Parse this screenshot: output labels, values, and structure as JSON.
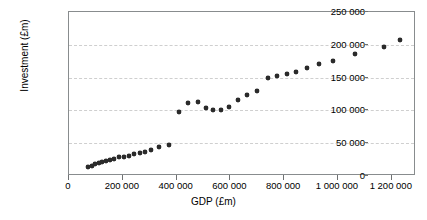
{
  "chart_data": {
    "type": "scatter",
    "title": "",
    "xlabel": "GDP (£m)",
    "ylabel": "Investment (£m)",
    "xlim": [
      0,
      1290000
    ],
    "ylim": [
      0,
      250000
    ],
    "grid": true,
    "legend": null,
    "x_ticks": [
      0,
      200000,
      400000,
      600000,
      800000,
      1000000,
      1200000
    ],
    "x_tick_labels": [
      "0",
      "200 000",
      "400 000",
      "600 000",
      "800 000",
      "1 000 000",
      "1 200 000"
    ],
    "y_ticks": [
      0,
      50000,
      100000,
      150000,
      200000,
      250000
    ],
    "y_tick_labels": [
      "0",
      "50 000",
      "100 000",
      "150 000",
      "200 000",
      "250 000"
    ],
    "marker": "filled-diamond",
    "marker_color": "#2b2b2b",
    "points": [
      {
        "x": 72000,
        "y": 14000
      },
      {
        "x": 85000,
        "y": 16000
      },
      {
        "x": 97000,
        "y": 18000
      },
      {
        "x": 110000,
        "y": 20000
      },
      {
        "x": 124000,
        "y": 21000
      },
      {
        "x": 139000,
        "y": 23000
      },
      {
        "x": 152000,
        "y": 25000
      },
      {
        "x": 167000,
        "y": 26000
      },
      {
        "x": 186000,
        "y": 29000
      },
      {
        "x": 205000,
        "y": 29000
      },
      {
        "x": 224000,
        "y": 31000
      },
      {
        "x": 243000,
        "y": 33000
      },
      {
        "x": 263000,
        "y": 35000
      },
      {
        "x": 283000,
        "y": 37000
      },
      {
        "x": 305000,
        "y": 40000
      },
      {
        "x": 333000,
        "y": 44000
      },
      {
        "x": 372000,
        "y": 48000
      },
      {
        "x": 408000,
        "y": 98000
      },
      {
        "x": 441000,
        "y": 112000
      },
      {
        "x": 478000,
        "y": 113000
      },
      {
        "x": 508000,
        "y": 104000
      },
      {
        "x": 535000,
        "y": 101000
      },
      {
        "x": 566000,
        "y": 100000
      },
      {
        "x": 596000,
        "y": 105000
      },
      {
        "x": 628000,
        "y": 116000
      },
      {
        "x": 663000,
        "y": 124000
      },
      {
        "x": 700000,
        "y": 130000
      },
      {
        "x": 740000,
        "y": 150000
      },
      {
        "x": 775000,
        "y": 153000
      },
      {
        "x": 810000,
        "y": 156000
      },
      {
        "x": 845000,
        "y": 158000
      },
      {
        "x": 886000,
        "y": 165000
      },
      {
        "x": 930000,
        "y": 170000
      },
      {
        "x": 980000,
        "y": 175000
      },
      {
        "x": 1063000,
        "y": 186000
      },
      {
        "x": 1172000,
        "y": 196000
      },
      {
        "x": 1230000,
        "y": 207000
      }
    ]
  }
}
